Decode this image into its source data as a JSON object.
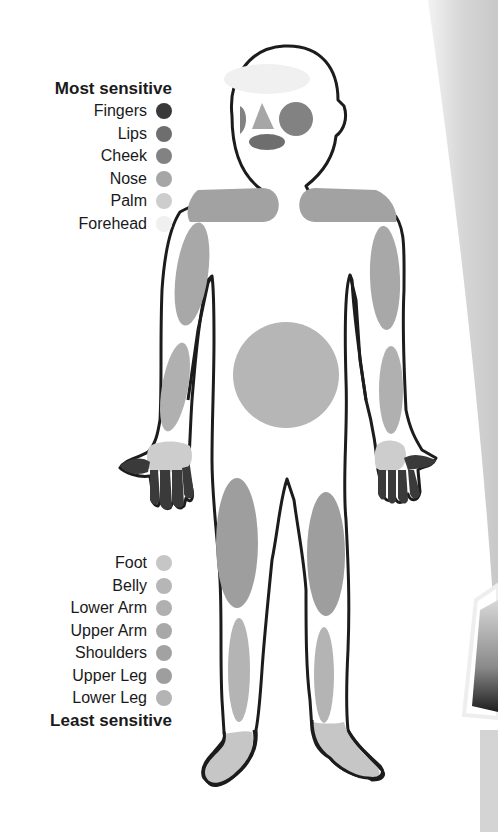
{
  "legend_top": {
    "title": "Most sensitive",
    "items": [
      {
        "label": "Fingers",
        "color": "#3a3a3a"
      },
      {
        "label": "Lips",
        "color": "#6e6e6e"
      },
      {
        "label": "Cheek",
        "color": "#828282"
      },
      {
        "label": "Nose",
        "color": "#a6a6a6"
      },
      {
        "label": "Palm",
        "color": "#cdcdcd"
      },
      {
        "label": "Forehead",
        "color": "#f0f0f0"
      }
    ]
  },
  "legend_bottom": {
    "items": [
      {
        "label": "Foot",
        "color": "#c6c6c6"
      },
      {
        "label": "Belly",
        "color": "#b6b6b6"
      },
      {
        "label": "Lower Arm",
        "color": "#b0b0b0"
      },
      {
        "label": "Upper Arm",
        "color": "#a8a8a8"
      },
      {
        "label": "Shoulders",
        "color": "#a2a2a2"
      },
      {
        "label": "Upper Leg",
        "color": "#9e9e9e"
      },
      {
        "label": "Lower Leg",
        "color": "#b4b4b4"
      }
    ],
    "title": "Least sensitive"
  },
  "colors": {
    "outline": "#1c1c1c",
    "body_fill": "#ffffff",
    "fingers": "#3a3a3a",
    "lips": "#6e6e6e",
    "cheek": "#828282",
    "nose": "#a6a6a6",
    "palm": "#cdcdcd",
    "forehead": "#f0f0f0",
    "foot": "#c6c6c6",
    "belly": "#b6b6b6",
    "lower_arm": "#b0b0b0",
    "upper_arm": "#a8a8a8",
    "shoulders": "#a2a2a2",
    "upper_leg": "#9e9e9e",
    "lower_leg": "#b4b4b4"
  }
}
